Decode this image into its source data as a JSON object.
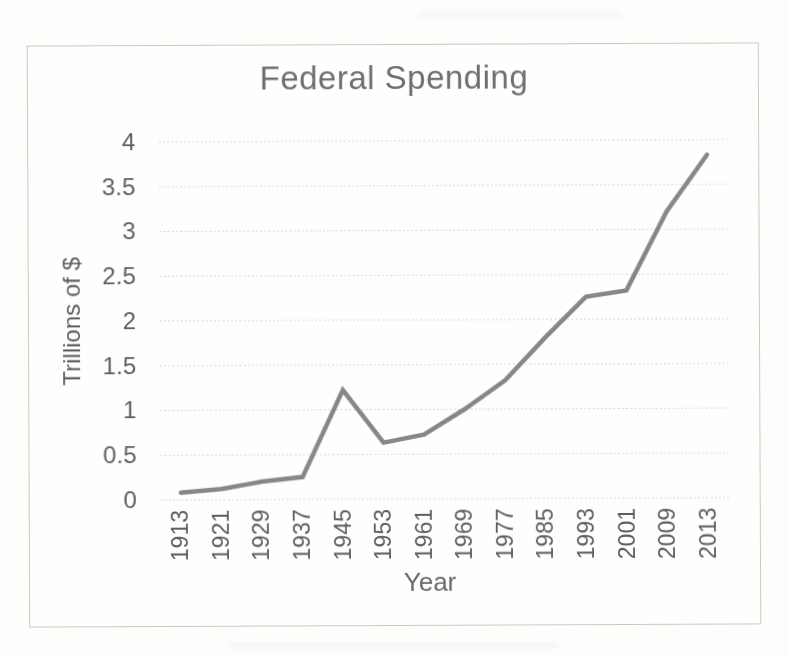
{
  "page": {
    "background": "#fcfcfb",
    "kind": "scanned line chart"
  },
  "chart_data": {
    "type": "line",
    "title": "Federal Spending",
    "xlabel": "Year",
    "ylabel": "Trillions of $",
    "categories": [
      "1913",
      "1921",
      "1929",
      "1937",
      "1945",
      "1953",
      "1961",
      "1969",
      "1977",
      "1985",
      "1993",
      "2001",
      "2009",
      "2013"
    ],
    "series": [
      {
        "name": "Federal Spending",
        "values": [
          0.08,
          0.12,
          0.2,
          0.25,
          1.22,
          0.63,
          0.72,
          1.0,
          1.32,
          1.8,
          2.25,
          2.32,
          3.2,
          3.83
        ]
      }
    ],
    "ylim": [
      0,
      4
    ],
    "ytick_step": 0.5,
    "ytick_labels": [
      "0",
      "0.5",
      "1",
      "1.5",
      "2",
      "2.5",
      "3",
      "3.5",
      "4"
    ],
    "grid": "horizontal-dotted",
    "legend": "none",
    "x_label_rotation": -90,
    "line_color": "#878787",
    "line_width": 4.5,
    "gridline_color": "#c8c8c4",
    "tick_text_color": "#5e5e5e",
    "title_color": "#6f6f6f",
    "frame_border_color": "#c9c9c4"
  }
}
